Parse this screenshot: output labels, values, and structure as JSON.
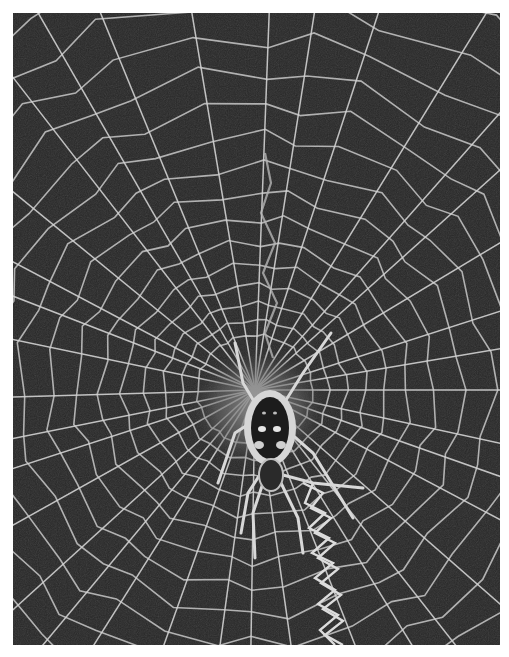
{
  "image": {
    "subject": "Orb-weaver spider at the center of its web",
    "style": "grayscale photograph",
    "colors": {
      "background": "#262626",
      "web_silk": "#cfcfcf",
      "hub_texture": "#8a8a8a",
      "spider_body_dark": "#1a1a1a",
      "spider_highlight": "#e0e0e0",
      "page_margin": "#ffffff"
    },
    "web": {
      "hub_center": [
        255,
        390
      ],
      "radial_spokes": 36,
      "spiral_rings": 22,
      "stabilimentum": "zigzag silk band running vertically below the spider"
    }
  },
  "caption": {
    "text": ""
  }
}
